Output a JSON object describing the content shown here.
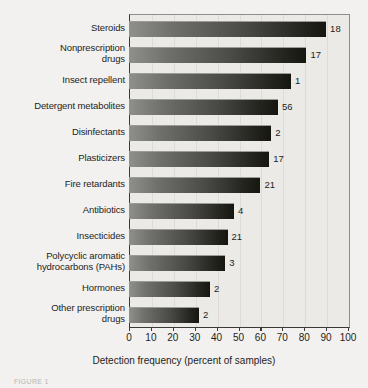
{
  "chart_data": {
    "type": "bar",
    "orientation": "horizontal",
    "title": "",
    "subtitle": "",
    "xlabel": "Detection frequency (percent of samples)",
    "ylabel": "",
    "xlim": [
      0,
      100
    ],
    "xticks": [
      "0",
      "10",
      "20",
      "30",
      "40",
      "50",
      "60",
      "70",
      "80",
      "90",
      "100"
    ],
    "grid": true,
    "legend": "none",
    "categories": [
      "Steroids",
      "Nonprescription\ndrugs",
      "Insect repellent",
      "Detergent metabolites",
      "Disinfectants",
      "Plasticizers",
      "Fire retardants",
      "Antibiotics",
      "Insecticides",
      "Polycyclic aromatic\nhydrocarbons (PAHs)",
      "Hormones",
      "Other prescription\ndrugs"
    ],
    "values": [
      90,
      81,
      74,
      68,
      65,
      64,
      60,
      48,
      45,
      44,
      37,
      32
    ],
    "annotations": [
      "18",
      "17",
      "1",
      "56",
      "2",
      "17",
      "21",
      "4",
      "21",
      "3",
      "2",
      "2"
    ],
    "bar_color_light": "#8f8f8c",
    "bar_color_dark": "#16160f",
    "plot_background": "#eceae6",
    "figure_background": "#f2f1ef"
  },
  "caption": {
    "fragment": "FIGURE 1"
  }
}
